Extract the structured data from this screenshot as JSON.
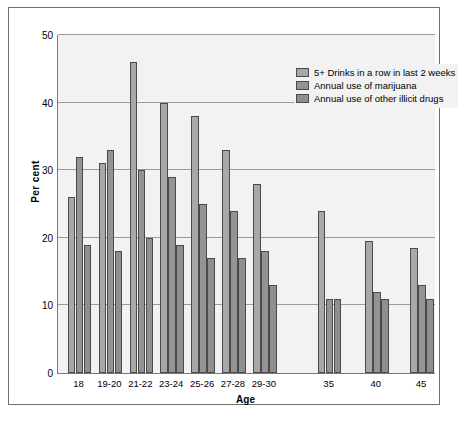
{
  "chart_data": {
    "type": "bar",
    "title": "",
    "xlabel": "Age",
    "ylabel": "Per cent",
    "ylim": [
      0,
      50
    ],
    "yticks": [
      0,
      10,
      20,
      30,
      40,
      50
    ],
    "grid": true,
    "legend_position": "top-right",
    "categories": [
      "18",
      "19-20",
      "21-22",
      "23-24",
      "25-26",
      "27-28",
      "29-30",
      "35",
      "40",
      "45"
    ],
    "series": [
      {
        "name": "5+ Drinks in a row in last 2 weeks",
        "color": "#a8a8a8",
        "values": [
          26,
          31,
          46,
          40,
          38,
          33,
          28,
          24,
          19.5,
          18.5
        ]
      },
      {
        "name": "Annual use of marijuana",
        "color": "#949494",
        "values": [
          32,
          33,
          30,
          29,
          25,
          24,
          18,
          11,
          12,
          13
        ]
      },
      {
        "name": "Annual use of other illicit drugs",
        "color": "#8f8f8f",
        "values": [
          19,
          18,
          20,
          19,
          17,
          17,
          13,
          11,
          11,
          11
        ]
      }
    ]
  },
  "legend": {
    "items": [
      "5+ Drinks in a row in last 2 weeks",
      "Annual use of marijuana",
      "Annual use of other illicit drugs"
    ]
  },
  "axes": {
    "y_title": "Per cent",
    "x_title": "Age",
    "y_tick_labels": [
      "0",
      "10",
      "20",
      "30",
      "40",
      "50"
    ],
    "x_tick_labels": [
      "18",
      "19-20",
      "21-22",
      "23-24",
      "25-26",
      "27-28",
      "29-30",
      "35",
      "40",
      "45"
    ]
  }
}
